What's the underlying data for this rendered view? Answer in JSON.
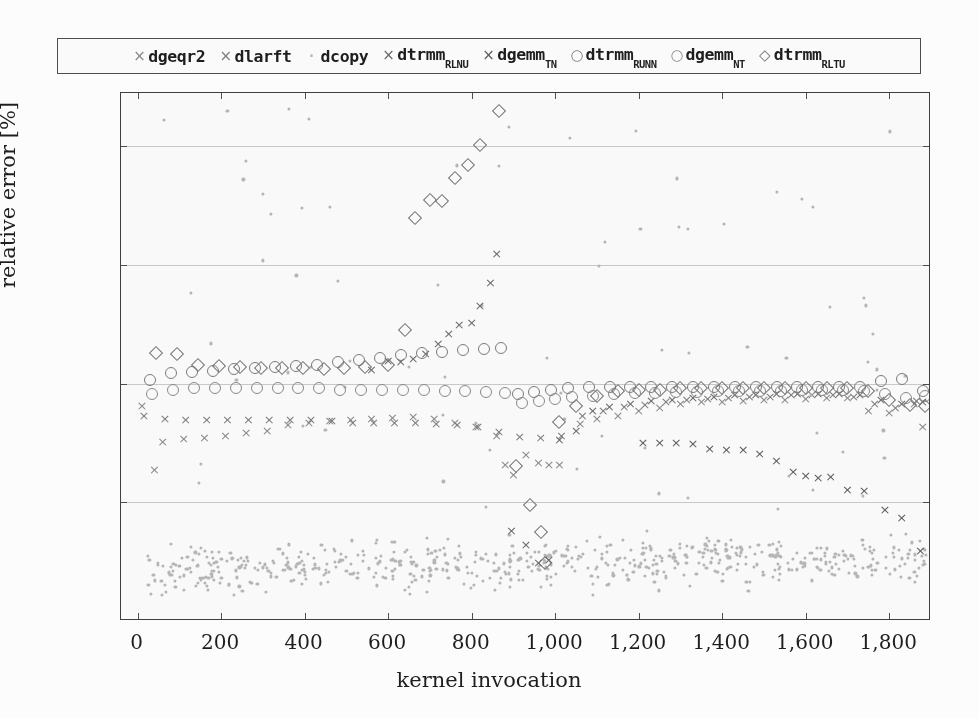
{
  "legend": {
    "items": [
      {
        "marker": "x",
        "glyph": "×",
        "name": "dgeqr2",
        "sub": "",
        "color": "#8a8a8a"
      },
      {
        "marker": "x",
        "glyph": "×",
        "name": "dlarft",
        "sub": "",
        "color": "#7d7d7d"
      },
      {
        "marker": "dot",
        "glyph": "·",
        "name": "dcopy",
        "sub": "",
        "color": "#b5b5b5"
      },
      {
        "marker": "x",
        "glyph": "×",
        "name": "dtrmm",
        "sub": "RLNU",
        "color": "#6a6a6a"
      },
      {
        "marker": "x",
        "glyph": "×",
        "name": "dgemm",
        "sub": "TN",
        "color": "#5c5c5c"
      },
      {
        "marker": "o",
        "glyph": "○",
        "name": "dtrmm",
        "sub": "RUNN",
        "color": "#7a7a7a"
      },
      {
        "marker": "o",
        "glyph": "○",
        "name": "dgemm",
        "sub": "NT",
        "color": "#888888"
      },
      {
        "marker": "d",
        "glyph": "◇",
        "name": "dtrmm",
        "sub": "RLTU",
        "color": "#6f6f6f"
      }
    ]
  },
  "axes": {
    "ylabel": "relative error [%]",
    "xlabel": "kernel invocation",
    "yticks": [
      "20",
      "10",
      "0",
      "−10",
      "−20"
    ],
    "ytick_values": [
      20,
      10,
      0,
      -10,
      -20
    ],
    "xticks": [
      "0",
      "200",
      "400",
      "600",
      "800",
      "1,000",
      "1,200",
      "1,400",
      "1,600",
      "1,800"
    ],
    "xtick_values": [
      0,
      200,
      400,
      600,
      800,
      1000,
      1200,
      1400,
      1600,
      1800
    ],
    "xlim": [
      -40,
      1900
    ],
    "ylim": [
      -20,
      24.5
    ]
  },
  "chart_data": {
    "type": "scatter",
    "title": "",
    "xlabel": "kernel invocation",
    "ylabel": "relative error [%]",
    "xlim": [
      -40,
      1900
    ],
    "ylim": [
      -20,
      24.5
    ],
    "grid": true,
    "legend_position": "above-plot",
    "series": [
      {
        "name": "dgeqr2",
        "marker": "x",
        "color": "#8a8a8a",
        "comment": "lower x-branch: starts near -2, dips to -5, climbs toward -1 then falls to -14 at right",
        "points": [
          [
            10,
            -1.8
          ],
          [
            40,
            -7.2
          ],
          [
            60,
            -4.8
          ],
          [
            110,
            -4.6
          ],
          [
            160,
            -4.5
          ],
          [
            210,
            -4.3
          ],
          [
            260,
            -4.1
          ],
          [
            310,
            -3.9
          ],
          [
            360,
            -3.4
          ],
          [
            410,
            -3.2
          ],
          [
            460,
            -3.1
          ],
          [
            510,
            -3.0
          ],
          [
            560,
            -2.9
          ],
          [
            610,
            -2.8
          ],
          [
            660,
            -2.7
          ],
          [
            710,
            -2.9
          ],
          [
            760,
            -3.2
          ],
          [
            810,
            -3.6
          ],
          [
            860,
            -4.3
          ],
          [
            880,
            -6.8
          ],
          [
            900,
            -7.6
          ],
          [
            930,
            -5.9
          ],
          [
            960,
            -6.6
          ],
          [
            985,
            -6.8
          ],
          [
            1010,
            -6.8
          ],
          [
            1060,
            -3.3
          ],
          [
            1100,
            -2.9
          ],
          [
            1150,
            -2.6
          ],
          [
            1200,
            -2.2
          ],
          [
            1250,
            -2.0
          ],
          [
            1300,
            -1.6
          ],
          [
            1350,
            -1.5
          ],
          [
            1400,
            -1.5
          ],
          [
            1450,
            -1.4
          ],
          [
            1500,
            -1.3
          ],
          [
            1550,
            -1.3
          ],
          [
            1600,
            -1.2
          ],
          [
            1650,
            -1.1
          ],
          [
            1700,
            -1.1
          ],
          [
            1750,
            -2.2
          ],
          [
            1800,
            -2.4
          ],
          [
            1860,
            -1.6
          ],
          [
            1880,
            -3.6
          ]
        ]
      },
      {
        "name": "dlarft",
        "marker": "x",
        "color": "#7d7d7d",
        "comment": "second x-branch in the -3 region hugging dgeqr2",
        "points": [
          [
            15,
            -2.6
          ],
          [
            65,
            -2.9
          ],
          [
            115,
            -3.0
          ],
          [
            165,
            -3.0
          ],
          [
            215,
            -3.0
          ],
          [
            265,
            -3.0
          ],
          [
            315,
            -3.0
          ],
          [
            365,
            -3.0
          ],
          [
            415,
            -3.0
          ],
          [
            465,
            -3.1
          ],
          [
            515,
            -3.2
          ],
          [
            565,
            -3.2
          ],
          [
            615,
            -3.2
          ],
          [
            665,
            -3.2
          ],
          [
            715,
            -3.3
          ],
          [
            765,
            -3.4
          ],
          [
            815,
            -3.6
          ],
          [
            865,
            -4.0
          ],
          [
            915,
            -4.4
          ],
          [
            965,
            -4.5
          ],
          [
            1015,
            -4.3
          ],
          [
            1065,
            -2.6
          ],
          [
            1115,
            -2.2
          ],
          [
            1165,
            -1.9
          ],
          [
            1215,
            -1.7
          ],
          [
            1265,
            -1.5
          ],
          [
            1315,
            -1.3
          ],
          [
            1365,
            -1.2
          ],
          [
            1415,
            -1.1
          ],
          [
            1465,
            -1.0
          ],
          [
            1515,
            -1.0
          ],
          [
            1565,
            -0.9
          ],
          [
            1615,
            -0.9
          ],
          [
            1665,
            -0.9
          ],
          [
            1715,
            -1.0
          ],
          [
            1765,
            -1.6
          ],
          [
            1815,
            -2.0
          ],
          [
            1865,
            -1.4
          ]
        ]
      },
      {
        "name": "dcopy",
        "marker": "dot",
        "color": "#b5b5b5",
        "comment": "dense noise cloud centered near -15.5, width ~2.5, spanning full x range; plus sparse outliers scattered in upper half",
        "cloud": {
          "x_range": [
            20,
            1890
          ],
          "y_center": -15.6,
          "y_spread": 2.3,
          "count": 620
        },
        "sparse_outliers": {
          "x_range": [
            60,
            1890
          ],
          "y_range": [
            -11,
            24
          ],
          "count": 70
        },
        "notable_points": [
          [
            215,
            23.0
          ],
          [
            260,
            18.8
          ],
          [
            300,
            16.0
          ],
          [
            320,
            14.3
          ],
          [
            1740,
            7.2
          ],
          [
            1745,
            6.6
          ],
          [
            1760,
            4.2
          ],
          [
            1770,
            1.2
          ]
        ]
      },
      {
        "name": "dtrmm_RLNU",
        "marker": "x",
        "color": "#6a6a6a",
        "comment": "rising x-branch from ~0 at x=600 to 11 at x=880, then collapses to -15 at x=980, recovers near 0",
        "points": [
          [
            560,
            1.2
          ],
          [
            600,
            2.0
          ],
          [
            630,
            1.9
          ],
          [
            660,
            2.2
          ],
          [
            690,
            2.6
          ],
          [
            720,
            3.4
          ],
          [
            745,
            4.3
          ],
          [
            770,
            5.0
          ],
          [
            800,
            5.2
          ],
          [
            820,
            6.6
          ],
          [
            845,
            8.6
          ],
          [
            860,
            11.0
          ],
          [
            895,
            -12.3
          ],
          [
            930,
            -13.5
          ],
          [
            960,
            -15.0
          ],
          [
            985,
            -14.8
          ],
          [
            1010,
            -4.7
          ],
          [
            1050,
            -3.9
          ],
          [
            1090,
            -2.2
          ],
          [
            1130,
            -1.9
          ],
          [
            1180,
            -1.6
          ],
          [
            1230,
            -1.4
          ],
          [
            1280,
            -1.3
          ],
          [
            1330,
            -1.1
          ],
          [
            1380,
            -1.0
          ],
          [
            1430,
            -0.9
          ],
          [
            1480,
            -0.9
          ],
          [
            1530,
            -0.8
          ],
          [
            1580,
            -0.8
          ],
          [
            1630,
            -0.8
          ],
          [
            1680,
            -0.8
          ],
          [
            1730,
            -0.9
          ],
          [
            1780,
            -1.3
          ],
          [
            1830,
            -1.6
          ],
          [
            1880,
            -1.5
          ]
        ]
      },
      {
        "name": "dgemm_TN",
        "marker": "x",
        "color": "#5c5c5c",
        "comment": "long descending right branch from -5 at x=1250 down to -14 at x=1870",
        "points": [
          [
            1210,
            -4.9
          ],
          [
            1250,
            -4.9
          ],
          [
            1290,
            -4.9
          ],
          [
            1330,
            -5.0
          ],
          [
            1370,
            -5.4
          ],
          [
            1410,
            -5.5
          ],
          [
            1450,
            -5.5
          ],
          [
            1490,
            -5.8
          ],
          [
            1530,
            -6.4
          ],
          [
            1570,
            -7.4
          ],
          [
            1600,
            -7.7
          ],
          [
            1630,
            -7.9
          ],
          [
            1660,
            -7.8
          ],
          [
            1700,
            -8.9
          ],
          [
            1740,
            -9.0
          ],
          [
            1790,
            -10.6
          ],
          [
            1830,
            -11.2
          ],
          [
            1875,
            -14.0
          ]
        ]
      },
      {
        "name": "dtrmm_RUNN",
        "marker": "o",
        "color": "#7a7a7a",
        "comment": "upper circle band slightly above zero, ~+1 to +3 until x=900 then drops to ~0",
        "points": [
          [
            30,
            0.3
          ],
          [
            80,
            0.9
          ],
          [
            130,
            1.0
          ],
          [
            180,
            1.1
          ],
          [
            230,
            1.2
          ],
          [
            280,
            1.3
          ],
          [
            330,
            1.4
          ],
          [
            380,
            1.5
          ],
          [
            430,
            1.6
          ],
          [
            480,
            1.8
          ],
          [
            530,
            2.0
          ],
          [
            580,
            2.2
          ],
          [
            630,
            2.4
          ],
          [
            680,
            2.6
          ],
          [
            730,
            2.7
          ],
          [
            780,
            2.8
          ],
          [
            830,
            2.9
          ],
          [
            870,
            3.0
          ],
          [
            910,
            -0.9
          ],
          [
            950,
            -0.7
          ],
          [
            990,
            -0.5
          ],
          [
            1030,
            -0.4
          ],
          [
            1080,
            -0.3
          ],
          [
            1130,
            -0.3
          ],
          [
            1180,
            -0.3
          ],
          [
            1230,
            -0.3
          ],
          [
            1280,
            -0.3
          ],
          [
            1330,
            -0.3
          ],
          [
            1380,
            -0.3
          ],
          [
            1430,
            -0.3
          ],
          [
            1480,
            -0.3
          ],
          [
            1530,
            -0.3
          ],
          [
            1580,
            -0.3
          ],
          [
            1630,
            -0.3
          ],
          [
            1680,
            -0.3
          ],
          [
            1730,
            -0.3
          ],
          [
            1780,
            0.2
          ],
          [
            1830,
            0.4
          ],
          [
            1880,
            -0.6
          ]
        ]
      },
      {
        "name": "dgemm_NT",
        "marker": "o",
        "color": "#888888",
        "comment": "lower circle band just below zero, tracks -0.3 to -1.5",
        "points": [
          [
            35,
            -0.9
          ],
          [
            85,
            -0.5
          ],
          [
            135,
            -0.4
          ],
          [
            185,
            -0.4
          ],
          [
            235,
            -0.4
          ],
          [
            285,
            -0.4
          ],
          [
            335,
            -0.4
          ],
          [
            385,
            -0.4
          ],
          [
            435,
            -0.4
          ],
          [
            485,
            -0.5
          ],
          [
            535,
            -0.5
          ],
          [
            585,
            -0.5
          ],
          [
            635,
            -0.5
          ],
          [
            685,
            -0.5
          ],
          [
            735,
            -0.6
          ],
          [
            785,
            -0.6
          ],
          [
            835,
            -0.7
          ],
          [
            880,
            -0.8
          ],
          [
            920,
            -1.6
          ],
          [
            960,
            -1.5
          ],
          [
            1000,
            -1.3
          ],
          [
            1040,
            -1.1
          ],
          [
            1090,
            -1.0
          ],
          [
            1140,
            -0.9
          ],
          [
            1190,
            -0.8
          ],
          [
            1240,
            -0.8
          ],
          [
            1290,
            -0.7
          ],
          [
            1340,
            -0.7
          ],
          [
            1390,
            -0.6
          ],
          [
            1440,
            -0.6
          ],
          [
            1490,
            -0.6
          ],
          [
            1540,
            -0.6
          ],
          [
            1590,
            -0.5
          ],
          [
            1640,
            -0.5
          ],
          [
            1690,
            -0.5
          ],
          [
            1740,
            -0.6
          ],
          [
            1790,
            -0.9
          ],
          [
            1840,
            -1.2
          ],
          [
            1885,
            -1.0
          ]
        ]
      },
      {
        "name": "dtrmm_RLTU",
        "marker": "d",
        "color": "#6f6f6f",
        "comment": "diamonds: flat near +2 then a steep ramp from 4.5 at x=650 up to the 23 peak at x=865, then a plunge to -15 by x=975",
        "points": [
          [
            45,
            2.6
          ],
          [
            95,
            2.5
          ],
          [
            145,
            1.6
          ],
          [
            195,
            1.5
          ],
          [
            245,
            1.4
          ],
          [
            295,
            1.3
          ],
          [
            345,
            1.3
          ],
          [
            395,
            1.3
          ],
          [
            445,
            1.2
          ],
          [
            495,
            1.3
          ],
          [
            545,
            1.4
          ],
          [
            600,
            1.6
          ],
          [
            640,
            4.5
          ],
          [
            665,
            14.0
          ],
          [
            700,
            15.5
          ],
          [
            730,
            15.4
          ],
          [
            760,
            17.3
          ],
          [
            790,
            18.4
          ],
          [
            820,
            20.1
          ],
          [
            865,
            23.0
          ],
          [
            905,
            -6.9
          ],
          [
            940,
            -10.2
          ],
          [
            965,
            -12.5
          ],
          [
            975,
            -15.1
          ],
          [
            1010,
            -3.2
          ],
          [
            1050,
            -1.9
          ],
          [
            1100,
            -1.0
          ],
          [
            1150,
            -0.6
          ],
          [
            1200,
            -0.5
          ],
          [
            1250,
            -0.5
          ],
          [
            1300,
            -0.4
          ],
          [
            1350,
            -0.4
          ],
          [
            1400,
            -0.4
          ],
          [
            1450,
            -0.4
          ],
          [
            1500,
            -0.4
          ],
          [
            1550,
            -0.4
          ],
          [
            1600,
            -0.4
          ],
          [
            1650,
            -0.4
          ],
          [
            1700,
            -0.4
          ],
          [
            1750,
            -0.6
          ],
          [
            1800,
            -1.4
          ],
          [
            1850,
            -1.8
          ],
          [
            1885,
            -1.9
          ]
        ]
      }
    ]
  }
}
